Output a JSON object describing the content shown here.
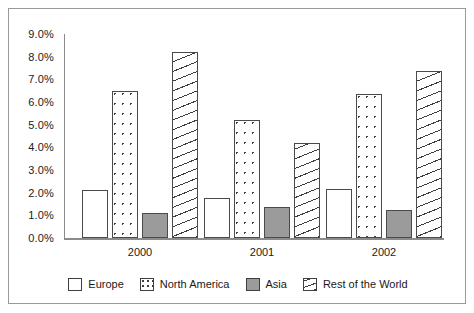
{
  "chart_data": {
    "type": "bar",
    "title": "",
    "subtitle": "",
    "xlabel": "",
    "ylabel": "",
    "categories": [
      "2000",
      "2001",
      "2002"
    ],
    "series": [
      {
        "name": "Europe",
        "values": [
          2.1,
          1.75,
          2.15
        ],
        "swatch": "white-outline"
      },
      {
        "name": "North America",
        "values": [
          6.5,
          5.2,
          6.35
        ],
        "swatch": "dotted"
      },
      {
        "name": "Asia",
        "values": [
          1.1,
          1.35,
          1.25
        ],
        "swatch": "solid-gray"
      },
      {
        "name": "Rest of the World",
        "values": [
          8.2,
          4.2,
          7.35
        ],
        "swatch": "diagonal-hatch"
      }
    ],
    "ylim": [
      0,
      9
    ],
    "ytick_values": [
      0,
      1,
      2,
      3,
      4,
      5,
      6,
      7,
      8,
      9
    ],
    "ytick_labels": [
      "0.0%",
      "1.0%",
      "2.0%",
      "3.0%",
      "4.0%",
      "5.0%",
      "6.0%",
      "7.0%",
      "8.0%",
      "9.0%"
    ],
    "grid": false,
    "legend_position": "bottom",
    "value_format": "percent"
  },
  "legend": {
    "entries": [
      {
        "label": "Europe"
      },
      {
        "label": "North America"
      },
      {
        "label": "Asia"
      },
      {
        "label": "Rest of the World"
      }
    ]
  },
  "colors": {
    "axis": "#8c8c8c",
    "bar_outline": "#4a4a4a",
    "asia_fill": "#9b9b9b",
    "text": "#1a1a1a",
    "frame": "#9a9a9a",
    "background": "#ffffff"
  }
}
